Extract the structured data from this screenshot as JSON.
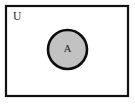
{
  "diagram": {
    "type": "venn",
    "title": "Venn diagram of set A inside universal set U",
    "canvas": {
      "width": 135,
      "height": 104,
      "background_color": "#ffffff"
    },
    "universe": {
      "label": "U",
      "label_x": 13,
      "label_y": 17,
      "rect_x": 6,
      "rect_y": 6,
      "rect_width": 122,
      "rect_height": 90,
      "fill_color": "#ffffff",
      "stroke_color": "#111111",
      "stroke_width": 2.2
    },
    "sets": [
      {
        "label": "A",
        "shape": "circle",
        "center_x": 67.5,
        "center_y": 49.5,
        "radius": 19.5,
        "fill_color": "#c2c2c2",
        "stroke_color": "#0d0d0d",
        "stroke_width": 2.6,
        "shaded": true,
        "label_x": 67.5,
        "label_y": 50
      }
    ]
  }
}
